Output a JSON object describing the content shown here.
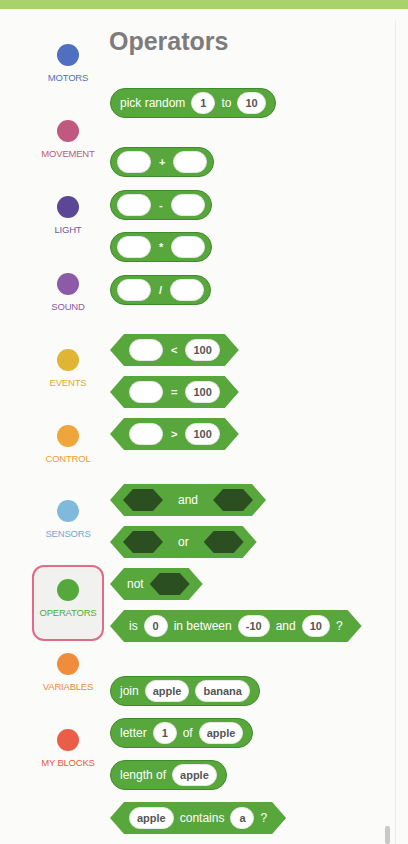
{
  "header": {
    "title": "Operators"
  },
  "sidebar": {
    "items": [
      {
        "label": "MOTORS",
        "color": "#4f6fc0",
        "text_color": "#4f72c0",
        "top": 44
      },
      {
        "label": "MOVEMENT",
        "color": "#c0587f",
        "text_color": "#c0587f",
        "top": 120
      },
      {
        "label": "LIGHT",
        "color": "#5b4796",
        "text_color": "#6b5a9e",
        "top": 196
      },
      {
        "label": "SOUND",
        "color": "#8c5aa6",
        "text_color": "#8c5aa6",
        "top": 273
      },
      {
        "label": "EVENTS",
        "color": "#e0b434",
        "text_color": "#d9ae2f",
        "top": 349
      },
      {
        "label": "CONTROL",
        "color": "#eda53c",
        "text_color": "#e6a035",
        "top": 425
      },
      {
        "label": "SENSORS",
        "color": "#7fbadd",
        "text_color": "#6ea9cf",
        "top": 500
      },
      {
        "label": "OPERATORS",
        "color": "#55a83b",
        "text_color": "#55a83b",
        "top": 565,
        "selected": true
      },
      {
        "label": "VARIABLES",
        "color": "#ef8d3c",
        "text_color": "#ea8a3a",
        "top": 653
      },
      {
        "label": "MY BLOCKS",
        "color": "#ea5d47",
        "text_color": "#e45a44",
        "top": 729
      }
    ]
  },
  "blocks": {
    "pick_random": {
      "text1": "pick random",
      "from": "1",
      "text2": "to",
      "to": "10"
    },
    "add": {
      "op": "+"
    },
    "subtract": {
      "op": "-"
    },
    "multiply": {
      "op": "*"
    },
    "divide": {
      "op": "/"
    },
    "less_than": {
      "op": "<",
      "value": "100"
    },
    "equals": {
      "op": "=",
      "value": "100"
    },
    "greater_than": {
      "op": ">",
      "value": "100"
    },
    "and": {
      "label": "and"
    },
    "or": {
      "label": "or"
    },
    "not": {
      "label": "not"
    },
    "in_between": {
      "t1": "is",
      "value": "0",
      "t2": "in between",
      "low": "-10",
      "t3": "and",
      "high": "10",
      "t4": "?"
    },
    "join": {
      "t1": "join",
      "a": "apple",
      "b": "banana"
    },
    "letter_of": {
      "t1": "letter",
      "index": "1",
      "t2": "of",
      "word": "apple"
    },
    "length_of": {
      "t1": "length of",
      "word": "apple"
    },
    "contains": {
      "word": "apple",
      "t1": "contains",
      "char": "a",
      "t2": "?"
    }
  },
  "colors": {
    "block_green": "#57a73c",
    "boolean_slot": "#2c4f22",
    "topbar": "#a9d26d",
    "selected_border": "#e06a8a"
  }
}
